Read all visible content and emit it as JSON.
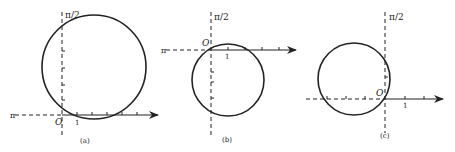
{
  "figure": {
    "panels": [
      {
        "id": "a",
        "caption": "(a)",
        "axis_polar_label": "π/2",
        "axis_left_label": "π",
        "origin_label": "O",
        "unit_label": "1",
        "circle": {
          "description": "circle tangent-ish above the polar axis, passing through origin",
          "center_units": [
            2,
            3
          ],
          "radius_units": 3.5
        }
      },
      {
        "id": "b",
        "caption": "(b)",
        "axis_polar_label": "π/2",
        "axis_left_label": "π",
        "origin_label": "O",
        "unit_label": "1",
        "circle": {
          "description": "circle below the polar axis, passing through origin",
          "center_units": [
            1,
            -2
          ],
          "radius_units": 2.4
        }
      },
      {
        "id": "c",
        "caption": "(c)",
        "axis_polar_label": "π/2",
        "origin_label": "O",
        "unit_label": "1",
        "circle": {
          "description": "circle to the left of the π/2 axis, passing through origin",
          "center_units": [
            -2,
            1.5
          ],
          "radius_units": 2.3
        }
      }
    ],
    "colors": {
      "stroke": "#222222",
      "background": "#ffffff"
    }
  }
}
